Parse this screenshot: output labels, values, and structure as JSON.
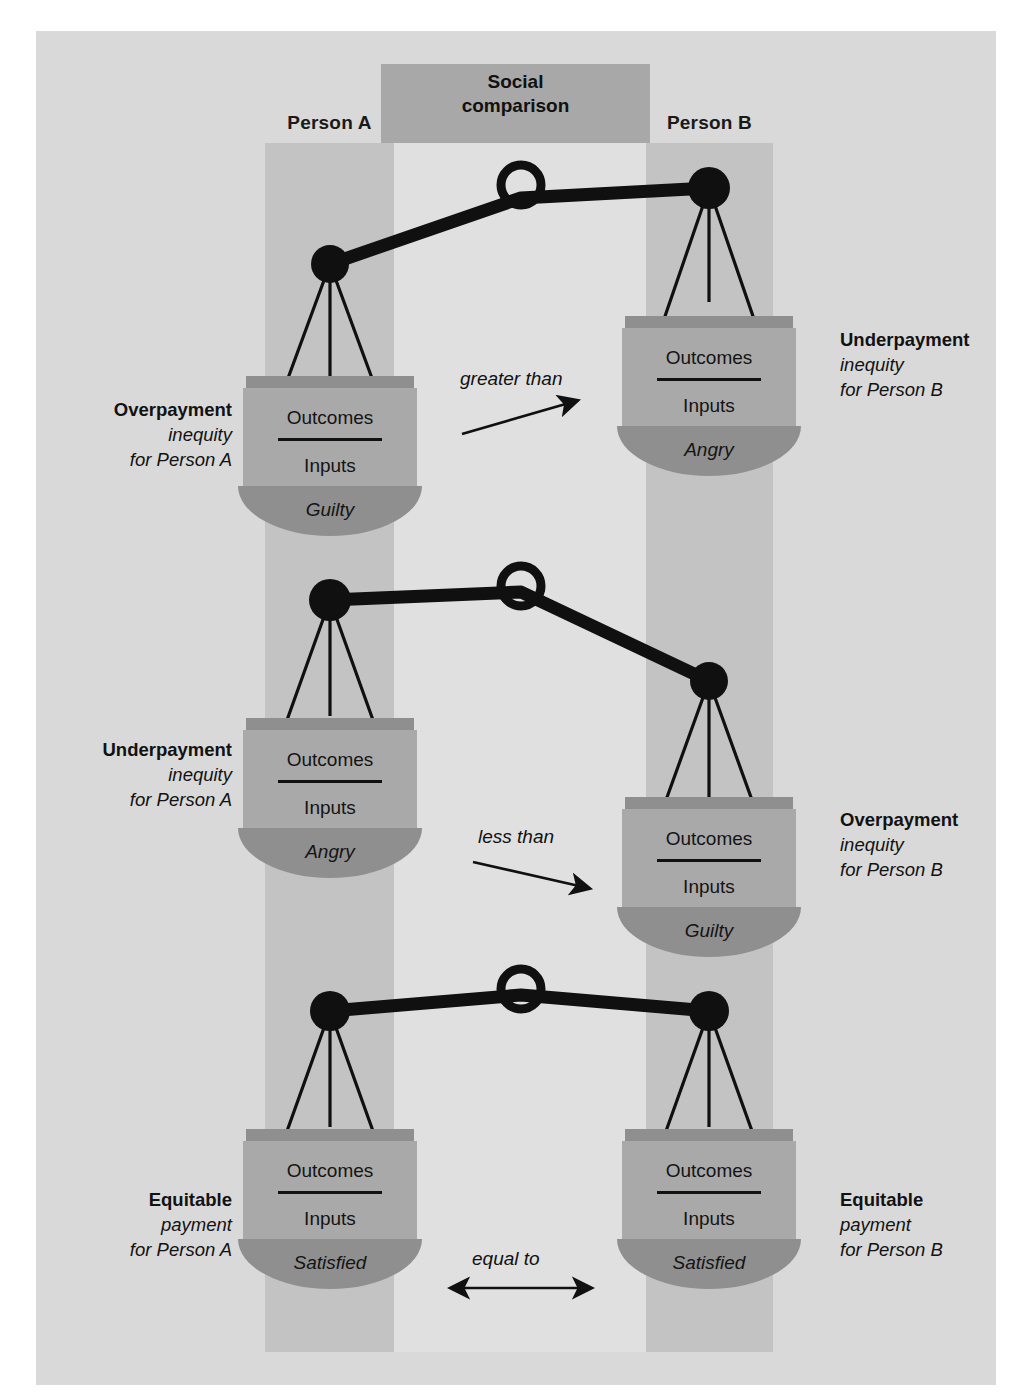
{
  "diagram": {
    "title_center": "Social\ncomparison",
    "social_comparison_line1": "Social",
    "social_comparison_line2": "comparison",
    "person_a": "Person A",
    "person_b": "Person B",
    "ratio_numerator": "Outcomes",
    "ratio_denominator": "Inputs",
    "colors": {
      "page_background": "#ffffff",
      "panel_background": "#d9d9d9",
      "column_band": "#c3c3c3",
      "center_light_band": "#e0e0e0",
      "social_box": "#a8a8a8",
      "pan_top_bar": "#8f8f8f",
      "pan_body": "#a9a9a9",
      "pan_bowl": "#8f8f8f",
      "ink": "#111111"
    }
  },
  "rows": [
    {
      "id": "row-overpayment-a",
      "tilt": "left-down",
      "relation": "greater than",
      "relation_arrow": "arrow-up-right",
      "left": {
        "side": "A",
        "title": "Overpayment",
        "subtitle_line1": "inequity",
        "subtitle_line2": "for Person A",
        "numerator": "Outcomes",
        "denominator": "Inputs",
        "emotion": "Guilty"
      },
      "right": {
        "side": "B",
        "title": "Underpayment",
        "subtitle_line1": "inequity",
        "subtitle_line2": "for Person B",
        "numerator": "Outcomes",
        "denominator": "Inputs",
        "emotion": "Angry"
      }
    },
    {
      "id": "row-underpayment-a",
      "tilt": "right-down",
      "relation": "less than",
      "relation_arrow": "arrow-down-right",
      "left": {
        "side": "A",
        "title": "Underpayment",
        "subtitle_line1": "inequity",
        "subtitle_line2": "for Person A",
        "numerator": "Outcomes",
        "denominator": "Inputs",
        "emotion": "Angry"
      },
      "right": {
        "side": "B",
        "title": "Overpayment",
        "subtitle_line1": "inequity",
        "subtitle_line2": "for Person B",
        "numerator": "Outcomes",
        "denominator": "Inputs",
        "emotion": "Guilty"
      }
    },
    {
      "id": "row-equitable",
      "tilt": "balanced",
      "relation": "equal to",
      "relation_arrow": "arrow-double-horizontal",
      "left": {
        "side": "A",
        "title": "Equitable",
        "subtitle_line1": "payment",
        "subtitle_line2": "for Person A",
        "numerator": "Outcomes",
        "denominator": "Inputs",
        "emotion": "Satisfied"
      },
      "right": {
        "side": "B",
        "title": "Equitable",
        "subtitle_line1": "payment",
        "subtitle_line2": "for Person B",
        "numerator": "Outcomes",
        "denominator": "Inputs",
        "emotion": "Satisfied"
      }
    }
  ]
}
